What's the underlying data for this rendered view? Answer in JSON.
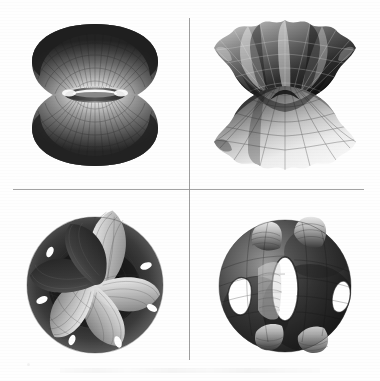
{
  "figure": {
    "kind": "mathematical-illustration",
    "medium": "scanned grayscale page",
    "background_color": "#fefefe",
    "width_px": 380,
    "height_px": 381,
    "panel_count": 4,
    "arrangement": "2x2 grid"
  },
  "dividers": {
    "style": "thin gray rule",
    "color": "#939393",
    "horizontal": {
      "x": 13,
      "y": 189,
      "length": 351
    },
    "vertical": {
      "x": 189,
      "y": 18,
      "length": 342
    }
  },
  "panels": [
    {
      "id": "top-left",
      "name": "catenoid-like-surface",
      "description": "Two flared bowl-shaped lobes joined at a narrow central neck, forming an hourglass of revolution",
      "lobes": 2,
      "holes": 0,
      "symmetry": "rotational (axisymmetric)",
      "mesh": "quadrilateral parametric grid",
      "shading": "dark rims fading to bright highlight at the inner throat",
      "bounds": {
        "x": 36,
        "y": 28,
        "w": 122,
        "h": 132
      }
    },
    {
      "id": "top-right",
      "name": "fluted-wavy-catenoid-surface",
      "description": "Catenoid-like saddle whose upper and lower rims undulate into scalloped waves",
      "rim_waves": 5,
      "holes": 0,
      "symmetry": "five-fold dihedral",
      "mesh": "curvilinear parametric grid",
      "shading": "dark folds alternating with pale crests, bright lower flare",
      "bounds": {
        "x": 212,
        "y": 26,
        "w": 140,
        "h": 140
      }
    },
    {
      "id": "bottom-left",
      "name": "six-lobed-rosette-surface",
      "description": "Rounded disc-like body scooped into six curved radial lobes around a dark central basin",
      "lobes": 6,
      "holes": 6,
      "symmetry": "six-fold rotational",
      "mesh": "fine quadrilateral parametric grid",
      "shading": "bright finely gridded lobes against a dark hollow core",
      "bounds": {
        "x": 32,
        "y": 216,
        "w": 136,
        "h": 138
      }
    },
    {
      "id": "bottom-right",
      "name": "genus-three-handled-surface",
      "description": "Rounded triply-perforated body with tubular handles and three open elliptical windows",
      "lobes": 4,
      "holes": 3,
      "symmetry": "cubic / Schwarz-P fundamental piece",
      "mesh": "banded parametric grid with ring bands",
      "shading": "mottled dark shell with pale banded tubes and white openings",
      "bounds": {
        "x": 213,
        "y": 213,
        "w": 138,
        "h": 142
      }
    }
  ],
  "palette": {
    "ink_darkest": "#141414",
    "ink_dark": "#3a3a3a",
    "ink_mid": "#6e6e6e",
    "ink_light": "#b4b4b4",
    "ink_pale": "#e2e2e2",
    "highlight": "#ffffff",
    "rule_gray": "#939393",
    "paper": "#fefefe"
  },
  "artifacts": {
    "bottom_smudge": "faint partially-cropped caption line at page bottom edge",
    "corner_speck": "small gray scan speck near lower-left"
  }
}
